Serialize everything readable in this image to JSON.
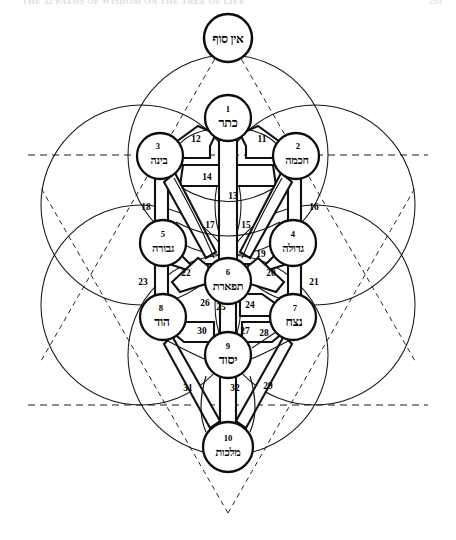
{
  "page": {
    "header_text": "THE 32 PATHS OF WISDOM ON THE TREE OF LIFE",
    "page_number": "293",
    "background_color": "#ffffff",
    "ink_color": "#000000",
    "width": 456,
    "height": 540
  },
  "diagram": {
    "type": "kabbalistic-tree-of-life",
    "crown_node": {
      "name": "ein-sof",
      "hebrew": "אין סוף",
      "transliteration": "Ein Sof",
      "cx": 228,
      "cy": 38,
      "r": 24
    },
    "sephirot": [
      {
        "id": "keter",
        "number": "1",
        "hebrew": "כתר",
        "transliteration": "Keter",
        "cx": 228,
        "cy": 118,
        "r": 23,
        "label_class": "heb-main"
      },
      {
        "id": "chokmah",
        "number": "2",
        "hebrew": "חכמה",
        "transliteration": "Chokmah",
        "cx": 296,
        "cy": 156,
        "r": 23,
        "label_class": "heb-long"
      },
      {
        "id": "binah",
        "number": "3",
        "hebrew": "בינה",
        "transliteration": "Binah",
        "cx": 160,
        "cy": 156,
        "r": 23,
        "label_class": "heb-long"
      },
      {
        "id": "gedulah",
        "number": "4",
        "hebrew": "גדולה",
        "transliteration": "Gedulah",
        "cx": 293,
        "cy": 243,
        "r": 23,
        "label_class": "heb-long"
      },
      {
        "id": "gevurah",
        "number": "5",
        "hebrew": "גבורה",
        "transliteration": "Gevurah",
        "cx": 163,
        "cy": 243,
        "r": 23,
        "label_class": "heb-long"
      },
      {
        "id": "tiferet",
        "number": "6",
        "hebrew": "תפארת",
        "transliteration": "Tiferet",
        "cx": 228,
        "cy": 281,
        "r": 23,
        "label_class": "heb-long"
      },
      {
        "id": "netzach",
        "number": "7",
        "hebrew": "נצח",
        "transliteration": "Netzach",
        "cx": 293,
        "cy": 317,
        "r": 23,
        "label_class": "heb-main"
      },
      {
        "id": "hod",
        "number": "8",
        "hebrew": "הוד",
        "transliteration": "Hod",
        "cx": 163,
        "cy": 317,
        "r": 23,
        "label_class": "heb-main"
      },
      {
        "id": "yesod",
        "number": "9",
        "hebrew": "יסוד",
        "transliteration": "Yesod",
        "cx": 228,
        "cy": 355,
        "r": 23,
        "label_class": "heb-main"
      },
      {
        "id": "malkuth",
        "number": "10",
        "hebrew": "מלכות",
        "transliteration": "Malkuth",
        "cx": 228,
        "cy": 447,
        "r": 25,
        "label_class": "heb-long"
      }
    ],
    "paths": [
      {
        "number": "11",
        "lx": 262,
        "ly": 139,
        "from": "keter",
        "to": "chokmah"
      },
      {
        "number": "12",
        "lx": 196,
        "ly": 139,
        "from": "keter",
        "to": "binah"
      },
      {
        "number": "13",
        "lx": 233,
        "ly": 195,
        "from": "keter",
        "to": "tiferet"
      },
      {
        "number": "14",
        "lx": 207,
        "ly": 175,
        "from": "chokmah",
        "to": "binah"
      },
      {
        "number": "15",
        "lx": 246,
        "ly": 224,
        "from": "chokmah",
        "to": "tiferet"
      },
      {
        "number": "16",
        "lx": 312,
        "ly": 206,
        "from": "chokmah",
        "to": "gedulah"
      },
      {
        "number": "17",
        "lx": 210,
        "ly": 224,
        "from": "binah",
        "to": "tiferet"
      },
      {
        "number": "18",
        "lx": 147,
        "ly": 206,
        "from": "binah",
        "to": "gevurah"
      },
      {
        "number": "19",
        "lx": 261,
        "ly": 253,
        "from": "gedulah",
        "to": "tiferet"
      },
      {
        "number": "20",
        "lx": 270,
        "ly": 272,
        "from": "tiferet",
        "to": "netzach"
      },
      {
        "number": "21",
        "lx": 312,
        "ly": 281,
        "from": "gedulah",
        "to": "netzach"
      },
      {
        "number": "22",
        "lx": 185,
        "ly": 272,
        "from": "gevurah",
        "to": "tiferet"
      },
      {
        "number": "23",
        "lx": 144,
        "ly": 281,
        "from": "gevurah",
        "to": "hod"
      },
      {
        "number": "24",
        "lx": 247,
        "ly": 304,
        "from": "tiferet",
        "to": "netzach"
      },
      {
        "number": "25",
        "lx": 220,
        "ly": 306,
        "from": "tiferet",
        "to": "yesod"
      },
      {
        "number": "26",
        "lx": 205,
        "ly": 303,
        "from": "tiferet",
        "to": "hod"
      },
      {
        "number": "27",
        "lx": 243,
        "ly": 330,
        "from": "netzach",
        "to": "hod"
      },
      {
        "number": "28",
        "lx": 262,
        "ly": 332,
        "from": "netzach",
        "to": "yesod"
      },
      {
        "number": "29",
        "lx": 266,
        "ly": 385,
        "from": "netzach",
        "to": "malkuth"
      },
      {
        "number": "30",
        "lx": 201,
        "ly": 330,
        "from": "hod",
        "to": "yesod"
      },
      {
        "number": "31",
        "lx": 188,
        "ly": 387,
        "from": "hod",
        "to": "malkuth"
      },
      {
        "number": "32",
        "lx": 234,
        "ly": 387,
        "from": "yesod",
        "to": "malkuth"
      }
    ],
    "outer_circles": [
      {
        "id": "circle-top",
        "cx": 228,
        "cy": 155,
        "r": 100
      },
      {
        "id": "circle-upper-left",
        "cx": 141,
        "cy": 205,
        "r": 100
      },
      {
        "id": "circle-upper-right",
        "cx": 315,
        "cy": 205,
        "r": 100
      },
      {
        "id": "circle-lower-left",
        "cx": 141,
        "cy": 305,
        "r": 100
      },
      {
        "id": "circle-lower-right",
        "cx": 315,
        "cy": 305,
        "r": 100
      },
      {
        "id": "circle-bottom",
        "cx": 228,
        "cy": 355,
        "r": 100
      }
    ],
    "hexagram": {
      "up_triangle": "228,55 314,405 142,405",
      "down_triangle": "228,505 314,155 142,155",
      "horizontal_top": "28,155 428,155",
      "horizontal_bottom": "28,405 428,405"
    }
  }
}
